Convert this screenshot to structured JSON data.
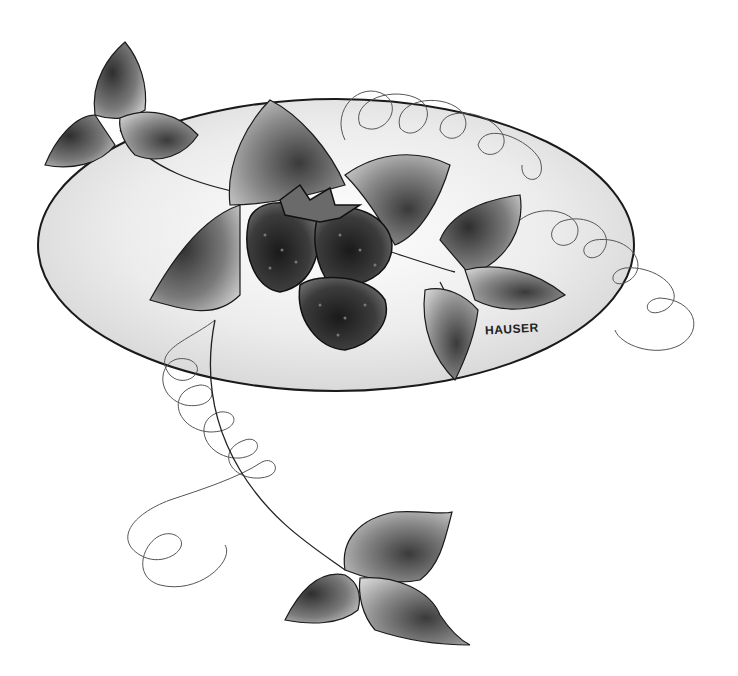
{
  "artwork": {
    "subject": "strawberries with leaves and curling vine tendrils over an oval plate",
    "signature": "HAUSER",
    "colors": {
      "background": "#ffffff",
      "plate_fill_center": "#ffffff",
      "plate_fill_edge": "#d8d8d8",
      "outline": "#1a1a1a",
      "leaf_dark": "#3a3a3a",
      "leaf_light": "#bdbdbd",
      "berry_dark": "#1e1e1e",
      "berry_mid": "#5a5a5a"
    }
  }
}
